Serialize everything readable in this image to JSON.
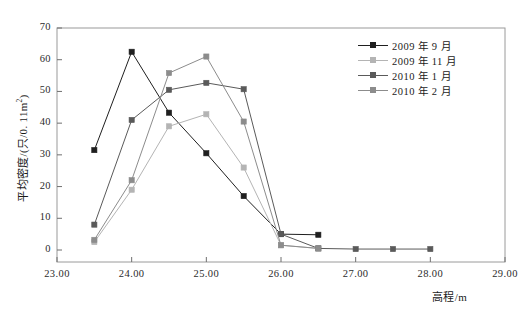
{
  "chart_data": {
    "type": "line",
    "title": "",
    "xlabel": "高程/m",
    "ylabel": "平均密度/(只/0.11m²)",
    "ylabel_base": "平均密度/(只/0. 11m",
    "ylabel_sup": "2",
    "ylabel_tail": ")",
    "xlim": [
      23.0,
      29.0
    ],
    "ylim": [
      0,
      70
    ],
    "xticks": [
      "23.00",
      "24.00",
      "25.00",
      "26.00",
      "27.00",
      "28.00",
      "29.00"
    ],
    "xtick_values": [
      23.0,
      24.0,
      25.0,
      26.0,
      27.0,
      28.0,
      29.0
    ],
    "yticks": [
      "0",
      "10",
      "20",
      "30",
      "40",
      "50",
      "60",
      "70"
    ],
    "ytick_values": [
      0,
      10,
      20,
      30,
      40,
      50,
      60,
      70
    ],
    "grid": false,
    "legend_position": "top-right",
    "series": [
      {
        "name": "2009 年 9 月",
        "color": "#1f1f1f",
        "marker": "square",
        "x": [
          23.5,
          24.0,
          24.5,
          25.0,
          25.5,
          26.0,
          26.5
        ],
        "y": [
          31.5,
          62.5,
          43.3,
          30.5,
          17.0,
          5.0,
          4.8
        ]
      },
      {
        "name": "2009 年 11 月",
        "color": "#b4b4b4",
        "marker": "square",
        "x": [
          23.5,
          24.0,
          24.5,
          25.0,
          25.5,
          26.0,
          26.5
        ],
        "y": [
          2.5,
          19.0,
          39.0,
          42.8,
          26.0,
          1.5,
          0.5
        ]
      },
      {
        "name": "2010 年 1 月",
        "color": "#5a5a5a",
        "marker": "square",
        "x": [
          23.5,
          24.0,
          24.5,
          25.0,
          25.5,
          26.0,
          26.5,
          27.0,
          27.5,
          28.0
        ],
        "y": [
          8.0,
          41.0,
          50.5,
          52.7,
          50.7,
          5.0,
          0.5,
          0.3,
          0.3,
          0.3
        ]
      },
      {
        "name": "2010 年 2 月",
        "color": "#8c8c8c",
        "marker": "square",
        "x": [
          23.5,
          24.0,
          24.5,
          25.0,
          25.5,
          26.0,
          26.5
        ],
        "y": [
          3.2,
          22.0,
          55.8,
          61.0,
          40.5,
          1.5,
          0.5
        ]
      }
    ]
  }
}
